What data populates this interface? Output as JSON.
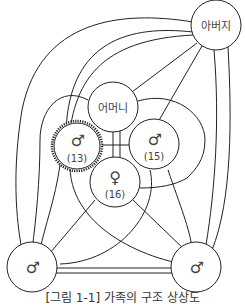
{
  "diagram": {
    "type": "family-relationship-diagram",
    "nodes": [
      {
        "id": "father",
        "label": "아버지"
      },
      {
        "id": "mother",
        "label": "어머니"
      },
      {
        "id": "son13",
        "symbol": "♂",
        "age": "(13)",
        "highlighted": true
      },
      {
        "id": "son15",
        "symbol": "♂",
        "age": "(15)"
      },
      {
        "id": "daughter16",
        "symbol": "♀",
        "age": "(16)"
      },
      {
        "id": "male_left",
        "symbol": "♂"
      },
      {
        "id": "male_right",
        "symbol": "♂"
      }
    ],
    "caption": "[그림 1-1] 가족의 구조 상상도"
  },
  "colors": {
    "line": "#222222",
    "text": "#444444",
    "background": "#ffffff"
  }
}
